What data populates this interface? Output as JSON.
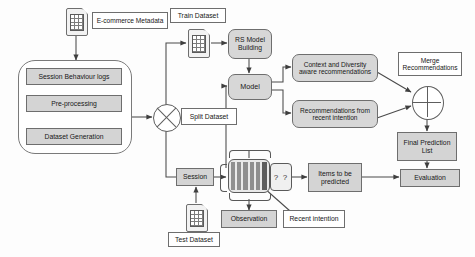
{
  "diagram": {
    "colors": {
      "node_fill": "#d4d4d4",
      "node_stroke": "#6e6e6e",
      "wire": "#4a4a4a",
      "background": "#fdfdfd",
      "sequence_slot": "#8f8f8f",
      "recent_slot": "#5d5d5d"
    },
    "nodes": {
      "ecommerce_metadata": "E-commerce Metadata",
      "session_behaviour_logs": "Session Behaviour logs",
      "pre_processing": "Pre-processing",
      "dataset_generation": "Dataset Generation",
      "split_dataset": "Split Dataset",
      "train_dataset": "Train Dataset",
      "test_dataset": "Test Dataset",
      "rs_model_building": "RS Model Building",
      "model": "Model",
      "context_diversity": "Context and Diversity aware recommendations",
      "recent_intention_recs": "Recommendations from recent intention",
      "merge_recommendations": "Merge Recommendations",
      "final_prediction_list": "Final Prediction List",
      "evaluation": "Evaluation",
      "session": "Session",
      "observation": "Observation",
      "recent_intention": "Recent intention",
      "items_to_be_predicted": "Items to be predicted",
      "unknown_items": "? ?"
    },
    "icons": {
      "metadata_doc": "table-document-icon",
      "train_doc": "table-document-icon",
      "test_doc": "table-document-icon",
      "split_operator": "cross-circle-icon",
      "merge_operator": "plus-circle-icon"
    }
  }
}
